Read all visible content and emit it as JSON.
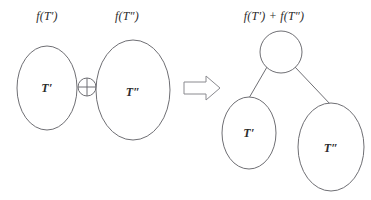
{
  "figure": {
    "background_color": "#ffffff",
    "stroke_color": "#6f6f74",
    "text_color": "#2b2b2b"
  },
  "left_operand": {
    "function_label": "f(T′)",
    "node_label": "T′"
  },
  "operator": {
    "symbol_name": "circled-plus",
    "symbol": "⊕"
  },
  "right_operand": {
    "function_label": "f(T″)",
    "node_label": "T″"
  },
  "implication": {
    "symbol_name": "hollow-right-arrow",
    "symbol": "⟹"
  },
  "result": {
    "function_label": "f(T′) + f(T″)",
    "root_label": "",
    "left_child_label": "T′",
    "right_child_label": "T″"
  }
}
